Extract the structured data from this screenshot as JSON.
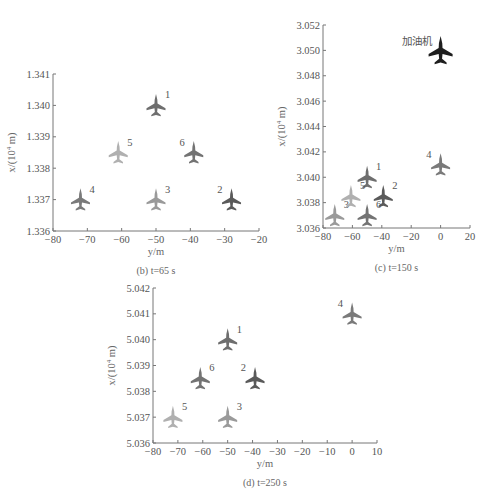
{
  "figure": {
    "top_caption_fragment": "",
    "panels": [
      "b",
      "c",
      "d"
    ]
  },
  "chart_data": [
    {
      "id": "b",
      "type": "scatter",
      "title": "(b) t=65 s",
      "caption": "(b) t=65 s",
      "xlabel": "y/m",
      "ylabel": "x/(10^4 m)",
      "xlim": [
        -80,
        -20
      ],
      "ylim": [
        1.336,
        1.341
      ],
      "xticks": [
        "-80",
        "-70",
        "-60",
        "-50",
        "-40",
        "-30",
        "-20"
      ],
      "yticks": [
        "1.336",
        "1.337",
        "1.338",
        "1.339",
        "1.340",
        "1.341"
      ],
      "grid": false,
      "points": [
        {
          "label": "1",
          "y": -50,
          "x": 1.34,
          "color": "#6e6e6e"
        },
        {
          "label": "2",
          "y": -28,
          "x": 1.337,
          "color": "#5a5a5a"
        },
        {
          "label": "3",
          "y": -50,
          "x": 1.337,
          "color": "#9a9a9a"
        },
        {
          "label": "4",
          "y": -72,
          "x": 1.337,
          "color": "#7a7a7a"
        },
        {
          "label": "5",
          "y": -61,
          "x": 1.3385,
          "color": "#b0b0b0"
        },
        {
          "label": "6",
          "y": -39,
          "x": 1.3385,
          "color": "#737373"
        }
      ]
    },
    {
      "id": "c",
      "type": "scatter",
      "title": "(c) t=150 s",
      "caption": "(c) t=150 s",
      "xlabel": "y/m",
      "ylabel": "x/(10^4 m)",
      "xlim": [
        -80,
        20
      ],
      "ylim": [
        3.036,
        3.052
      ],
      "xticks": [
        "-80",
        "-60",
        "-40",
        "-20",
        "0",
        "20"
      ],
      "yticks": [
        "3.036",
        "3.038",
        "3.040",
        "3.042",
        "3.044",
        "3.046",
        "3.048",
        "3.050",
        "3.052"
      ],
      "grid": false,
      "annotation": "加油机",
      "points": [
        {
          "label": "加油机",
          "y": 0,
          "x": 3.05,
          "color": "#1e1e1e"
        },
        {
          "label": "1",
          "y": -50,
          "x": 3.04,
          "color": "#6e6e6e"
        },
        {
          "label": "2",
          "y": -39,
          "x": 3.0385,
          "color": "#5a5a5a"
        },
        {
          "label": "3",
          "y": -72,
          "x": 3.037,
          "color": "#9a9a9a"
        },
        {
          "label": "4",
          "y": 0,
          "x": 3.041,
          "color": "#7a7a7a"
        },
        {
          "label": "5",
          "y": -61,
          "x": 3.0385,
          "color": "#b0b0b0"
        },
        {
          "label": "6",
          "y": -50,
          "x": 3.037,
          "color": "#737373"
        }
      ]
    },
    {
      "id": "d",
      "type": "scatter",
      "title": "(d) t=250 s",
      "caption": "(d) t=250 s",
      "xlabel": "y/m",
      "ylabel": "x/(10^4 m)",
      "xlim": [
        -80,
        10
      ],
      "ylim": [
        5.036,
        5.042
      ],
      "xticks": [
        "-80",
        "-70",
        "-60",
        "-50",
        "-40",
        "-30",
        "-20",
        "-10",
        "0",
        "10"
      ],
      "yticks": [
        "5.036",
        "5.037",
        "5.038",
        "5.039",
        "5.040",
        "5.041",
        "5.042"
      ],
      "grid": false,
      "points": [
        {
          "label": "1",
          "y": -50,
          "x": 5.04,
          "color": "#6e6e6e"
        },
        {
          "label": "2",
          "y": -39,
          "x": 5.0385,
          "color": "#5a5a5a"
        },
        {
          "label": "3",
          "y": -50,
          "x": 5.037,
          "color": "#9a9a9a"
        },
        {
          "label": "4",
          "y": 0,
          "x": 5.041,
          "color": "#7a7a7a"
        },
        {
          "label": "5",
          "y": -72,
          "x": 5.037,
          "color": "#b0b0b0"
        },
        {
          "label": "6",
          "y": -61,
          "x": 5.0385,
          "color": "#737373"
        }
      ]
    }
  ],
  "layout": {
    "b": {
      "left": 53,
      "right": 259,
      "top": 74,
      "bottom": 231,
      "label_side": {
        "1": "r",
        "2": "l",
        "3": "r",
        "4": "r",
        "5": "r",
        "6": "l"
      }
    },
    "c": {
      "left": 323,
      "right": 470,
      "top": 25,
      "bottom": 228,
      "label_side": {
        "加油机": "l",
        "1": "r",
        "2": "r",
        "3": "r",
        "4": "l",
        "5": "r",
        "6": "r"
      }
    },
    "d": {
      "left": 153,
      "right": 377,
      "top": 288,
      "bottom": 443,
      "label_side": {
        "1": "r",
        "2": "l",
        "3": "r",
        "4": "l",
        "5": "r",
        "6": "r"
      }
    }
  }
}
